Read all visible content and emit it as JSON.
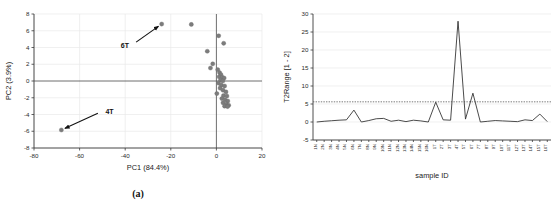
{
  "figure": {
    "caption_a": "(a)",
    "caption_b": "(b)"
  },
  "chart_data": [
    {
      "id": "panel-a",
      "type": "scatter",
      "title": "",
      "xlabel": "PC1 (84.4%)",
      "ylabel": "PC2 (3.9%)",
      "xlim": [
        -80,
        20
      ],
      "ylim": [
        -8,
        8
      ],
      "xticks": [
        -80,
        -60,
        -40,
        -20,
        0,
        20
      ],
      "yticks": [
        8,
        6,
        4,
        2,
        0,
        -2,
        -4,
        -6,
        -8
      ],
      "grid": true,
      "legend": "none",
      "marker_color": "#7c7c7c",
      "annotations": [
        {
          "label": "6T",
          "target_x": -24.0,
          "target_y": 6.8,
          "text_x": -37.0,
          "text_y": 4.3
        },
        {
          "label": "4T",
          "target_x": -68.0,
          "target_y": -5.85,
          "text_x": -50.0,
          "text_y": -3.6
        }
      ],
      "points": [
        {
          "x": -68.0,
          "y": -5.85,
          "label": "4T"
        },
        {
          "x": -24.0,
          "y": 6.8,
          "label": "6T"
        },
        {
          "x": -11.0,
          "y": 6.75,
          "label": ""
        },
        {
          "x": 1.0,
          "y": 5.4,
          "label": ""
        },
        {
          "x": 3.2,
          "y": 4.5,
          "label": ""
        },
        {
          "x": -4.0,
          "y": 3.55,
          "label": ""
        },
        {
          "x": -1.6,
          "y": 2.05,
          "label": ""
        },
        {
          "x": -2.6,
          "y": 1.55,
          "label": ""
        },
        {
          "x": 0.6,
          "y": 1.35,
          "label": ""
        },
        {
          "x": 1.4,
          "y": 1.0,
          "label": ""
        },
        {
          "x": 2.0,
          "y": 0.75,
          "label": ""
        },
        {
          "x": 1.2,
          "y": 0.5,
          "label": ""
        },
        {
          "x": 2.6,
          "y": 0.45,
          "label": ""
        },
        {
          "x": 3.4,
          "y": 0.35,
          "label": ""
        },
        {
          "x": 1.8,
          "y": 0.1,
          "label": ""
        },
        {
          "x": 2.8,
          "y": 0.0,
          "label": ""
        },
        {
          "x": 0.9,
          "y": -0.25,
          "label": ""
        },
        {
          "x": 2.2,
          "y": -0.5,
          "label": ""
        },
        {
          "x": 3.6,
          "y": -0.6,
          "label": ""
        },
        {
          "x": 1.6,
          "y": -0.85,
          "label": ""
        },
        {
          "x": 2.9,
          "y": -1.1,
          "label": ""
        },
        {
          "x": 4.2,
          "y": -1.3,
          "label": ""
        },
        {
          "x": 0.2,
          "y": -1.5,
          "label": ""
        },
        {
          "x": 3.1,
          "y": -1.75,
          "label": ""
        },
        {
          "x": 4.6,
          "y": -1.8,
          "label": ""
        },
        {
          "x": 2.4,
          "y": -2.1,
          "label": ""
        },
        {
          "x": 3.8,
          "y": -2.25,
          "label": ""
        },
        {
          "x": 5.0,
          "y": -2.4,
          "label": ""
        },
        {
          "x": 2.9,
          "y": -2.6,
          "label": ""
        },
        {
          "x": 4.4,
          "y": -2.75,
          "label": ""
        },
        {
          "x": 5.4,
          "y": -2.9,
          "label": ""
        },
        {
          "x": 3.6,
          "y": -3.0,
          "label": ""
        },
        {
          "x": 4.9,
          "y": -3.05,
          "label": ""
        }
      ]
    },
    {
      "id": "panel-b",
      "type": "line",
      "title": "",
      "xlabel": "sample ID",
      "ylabel": "T2Range [1 - 2]",
      "ylim": [
        -5,
        30
      ],
      "yticks": [
        30,
        25,
        20,
        15,
        10,
        5,
        0,
        -5
      ],
      "grid": true,
      "legend": "none",
      "line_color": "#2b2b2b",
      "threshold": {
        "value": 5.6,
        "style": "dotted",
        "color": "#555555"
      },
      "categories": [
        "1N",
        "2N",
        "3N",
        "4N",
        "5N",
        "6N",
        "7N",
        "8N",
        "9N",
        "10N",
        "11N",
        "12N",
        "13N",
        "14N",
        "15N",
        "16N",
        "1T",
        "2T",
        "3T",
        "4T",
        "5T",
        "6T",
        "7T",
        "8T",
        "9T",
        "10T",
        "11T",
        "12T",
        "13T",
        "14T",
        "15T",
        "16T"
      ],
      "values": [
        0.0,
        0.2,
        0.35,
        0.5,
        0.6,
        3.3,
        0.0,
        0.4,
        0.9,
        1.0,
        0.2,
        0.5,
        0.1,
        0.5,
        0.3,
        0.0,
        5.5,
        0.6,
        0.5,
        28.0,
        0.8,
        8.0,
        0.0,
        0.2,
        0.4,
        0.3,
        0.2,
        0.1,
        0.6,
        0.4,
        2.2,
        0.1
      ]
    }
  ]
}
